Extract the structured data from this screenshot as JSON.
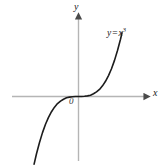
{
  "figure": {
    "background_color": "#ffffff",
    "width": 164,
    "height": 165,
    "axis_color": "#b5b5b5",
    "curve_color": "#1c1c1c",
    "label_color": "#1a1a1a"
  },
  "labels": {
    "y_axis": "y",
    "x_axis": "x",
    "origin": "0",
    "curve_lhs": "y",
    "curve_eq": "=",
    "curve_base": "x",
    "curve_exponent": "3"
  },
  "chart_data": {
    "type": "line",
    "title": "",
    "subtitle": "",
    "xlabel": "x",
    "ylabel": "y",
    "annotations": [
      {
        "text": "y = x³",
        "x": 1.45,
        "y": 2.9
      },
      {
        "text": "0",
        "x": -0.18,
        "y": -0.22
      }
    ],
    "grid": false,
    "legend": false,
    "legend_position": "none",
    "xlim": [
      -2.2,
      2.2
    ],
    "ylim": [
      -3.4,
      3.4
    ],
    "xticks": [],
    "yticks": [],
    "xticklabels": [],
    "yticklabels": [],
    "series": [
      {
        "name": "y = x^3",
        "equation": "y = x^3",
        "color": "#1c1c1c",
        "linewidth": 1.6,
        "x": [
          -1.48,
          -1.4,
          -1.3,
          -1.2,
          -1.1,
          -1.0,
          -0.9,
          -0.8,
          -0.7,
          -0.6,
          -0.5,
          -0.4,
          -0.3,
          -0.2,
          -0.1,
          0.0,
          0.1,
          0.2,
          0.3,
          0.4,
          0.5,
          0.6,
          0.7,
          0.8,
          0.9,
          1.0,
          1.1,
          1.2,
          1.3,
          1.4,
          1.45
        ],
        "y": [
          -3.24,
          -2.74,
          -2.2,
          -1.73,
          -1.33,
          -1.0,
          -0.73,
          -0.51,
          -0.34,
          -0.22,
          -0.13,
          -0.06,
          -0.03,
          -0.01,
          0.0,
          0.0,
          0.0,
          0.01,
          0.03,
          0.06,
          0.13,
          0.22,
          0.34,
          0.51,
          0.73,
          1.0,
          1.33,
          1.73,
          2.2,
          2.74,
          3.05
        ]
      }
    ]
  }
}
